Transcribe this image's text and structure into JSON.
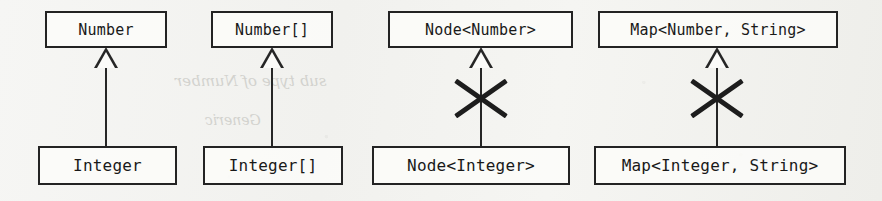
{
  "figure": {
    "kind": "uml-generalization-diagram",
    "background_color": "#f4f4f1",
    "stroke_color": "#232323",
    "text_color": "#191919",
    "invalid_mark_color": "#1d1d1d"
  },
  "bleed_through": {
    "line_1": "sub type of Number",
    "line_2": "Generic"
  },
  "relations": [
    {
      "id": "number-integer",
      "supertype": "Number",
      "subtype": "Integer",
      "relation": "generalization",
      "valid": true,
      "marked_invalid": false
    },
    {
      "id": "number-array-integer-array",
      "supertype": "Number[]",
      "subtype": "Integer[]",
      "relation": "generalization",
      "valid": true,
      "marked_invalid": false
    },
    {
      "id": "node-number-node-integer",
      "supertype": "Node<Number>",
      "subtype": "Node<Integer>",
      "relation": "generalization",
      "valid": false,
      "marked_invalid": true
    },
    {
      "id": "map-number-string-map-integer-string",
      "supertype": "Map<Number, String>",
      "subtype": "Map<Integer, String>",
      "relation": "generalization",
      "valid": false,
      "marked_invalid": true
    }
  ]
}
